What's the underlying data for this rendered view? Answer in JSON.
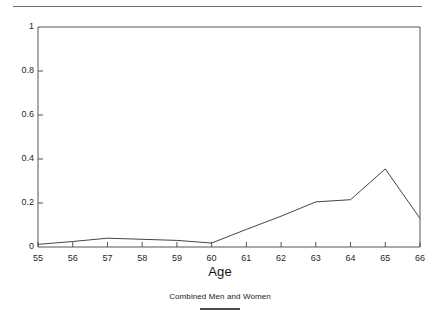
{
  "figure": {
    "top_rule": true,
    "axis_title": "Age",
    "caption": "Combined Men and Women"
  },
  "chart_data": {
    "type": "line",
    "title": "",
    "subtitle": "",
    "xlabel": "Age",
    "ylabel": "",
    "categories": [
      55,
      56,
      57,
      58,
      59,
      60,
      61,
      62,
      63,
      64,
      65,
      66
    ],
    "x": [
      55,
      56,
      57,
      58,
      59,
      60,
      61,
      62,
      63,
      64,
      65,
      66
    ],
    "values": [
      0.012,
      0.025,
      0.04,
      0.035,
      0.03,
      0.018,
      0.08,
      0.14,
      0.205,
      0.215,
      0.355,
      0.13
    ],
    "series": [
      {
        "name": "Combined Men and Women",
        "values": [
          0.012,
          0.025,
          0.04,
          0.035,
          0.03,
          0.018,
          0.08,
          0.14,
          0.205,
          0.215,
          0.355,
          0.13
        ]
      }
    ],
    "xlim": [
      55,
      66
    ],
    "ylim": [
      0,
      1
    ],
    "xticks": [
      55,
      56,
      57,
      58,
      59,
      60,
      61,
      62,
      63,
      64,
      65,
      66
    ],
    "yticks": [
      0,
      0.2,
      0.4,
      0.6,
      0.8,
      1
    ],
    "ytick_labels": [
      "0",
      "0.2",
      "0.4",
      "0.6",
      "0.8",
      "1"
    ],
    "xtick_labels": [
      "55",
      "56",
      "57",
      "58",
      "59",
      "60",
      "61",
      "62",
      "63",
      "64",
      "65",
      "66"
    ],
    "grid": false,
    "legend_position": "below-axis",
    "legend_entries": [
      "Combined Men and Women"
    ],
    "line_color": "#444444",
    "frame_color": "#555555",
    "background_color": "#ffffff"
  }
}
